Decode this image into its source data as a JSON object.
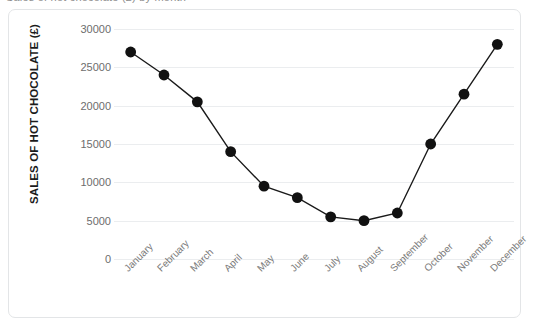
{
  "page": {
    "cropped_title": "Sales of hot chocolate (£) by month"
  },
  "chart_data": {
    "type": "line",
    "title": "",
    "xlabel": "",
    "ylabel": "SALES OF HOT CHOCOLATE (£)",
    "categories": [
      "January",
      "February",
      "March",
      "April",
      "May",
      "June",
      "July",
      "August",
      "September",
      "October",
      "November",
      "December"
    ],
    "values": [
      27000,
      24000,
      20500,
      14000,
      9500,
      8000,
      5500,
      5000,
      6000,
      15000,
      21500,
      28000
    ],
    "ylim": [
      0,
      30000
    ],
    "yticks": [
      0,
      5000,
      10000,
      15000,
      20000,
      25000,
      30000
    ],
    "ytick_labels": [
      "0",
      "5000",
      "10000",
      "15000",
      "20000",
      "25000",
      "30000"
    ],
    "grid": "horizontal",
    "legend": "none",
    "marker": "circle",
    "marker_color": "#111111",
    "line_color": "#1a1a1a",
    "background_color": "#ffffff",
    "grid_color": "#ebedef",
    "border_color": "#e3e5e7"
  }
}
